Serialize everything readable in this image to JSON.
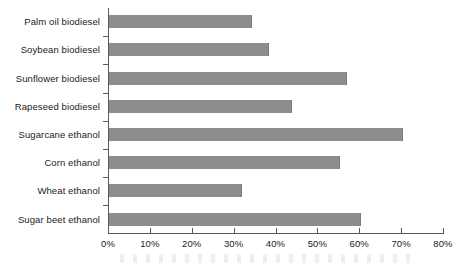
{
  "chart_data": {
    "type": "bar",
    "orientation": "horizontal",
    "title": "",
    "subtitle": "",
    "xlabel": "",
    "ylabel": "",
    "categories": [
      "Palm oil biodiesel",
      "Soybean biodiesel",
      "Sunflower biodiesel",
      "Rapeseed biodiesel",
      "Sugarcane ethanol",
      "Corn ethanol",
      "Wheat ethanol",
      "Sugar beet ethanol"
    ],
    "values": [
      34.5,
      38.5,
      57.0,
      44.0,
      70.5,
      55.5,
      32.0,
      60.5
    ],
    "value_unit": "%",
    "xlim": [
      0,
      80
    ],
    "x_tick_values": [
      0,
      10,
      20,
      30,
      40,
      50,
      60,
      70,
      80
    ],
    "x_tick_labels": [
      "0%",
      "10%",
      "20%",
      "30%",
      "40%",
      "50%",
      "60%",
      "70%",
      "80%"
    ],
    "grid": false,
    "legend": null,
    "legend_position": "none",
    "series": [
      {
        "name": "",
        "values": [
          34.5,
          38.5,
          57.0,
          44.0,
          70.5,
          55.5,
          32.0,
          60.5
        ]
      }
    ]
  },
  "colors": {
    "bar_fill": "#8d8d8d",
    "axis": "#5a5a5a",
    "text": "#1b1b1b",
    "background": "#ffffff"
  }
}
